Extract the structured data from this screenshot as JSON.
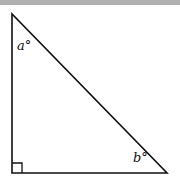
{
  "figure": {
    "type": "right-triangle",
    "labels": {
      "angle_top": "a°",
      "angle_right": "b°"
    },
    "right_angle_marker": true,
    "colors": {
      "stroke": "#111111",
      "background": "#ffffff",
      "top_band": "#b0b0b0"
    }
  }
}
